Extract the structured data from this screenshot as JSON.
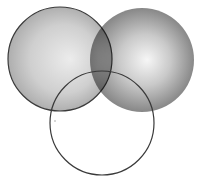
{
  "diagram": {
    "type": "venn",
    "width": 205,
    "height": 184,
    "circles": [
      {
        "id": "left",
        "cx": 60,
        "cy": 59,
        "r": 52,
        "fill_center": "#e6e6e6",
        "fill_edge": "#a8a8a8",
        "stroke": "#3a3a3a",
        "stroke_width": 1.2
      },
      {
        "id": "right",
        "cx": 142,
        "cy": 60,
        "r": 52,
        "fill_center": "#f4f4f4",
        "fill_edge": "#7a7a7a",
        "stroke": "none",
        "stroke_width": 0
      },
      {
        "id": "bottom",
        "cx": 102,
        "cy": 123,
        "r": 52,
        "fill_center": "none",
        "fill_edge": "none",
        "stroke": "#3a3a3a",
        "stroke_width": 1.2
      }
    ],
    "background": "#ffffff"
  }
}
